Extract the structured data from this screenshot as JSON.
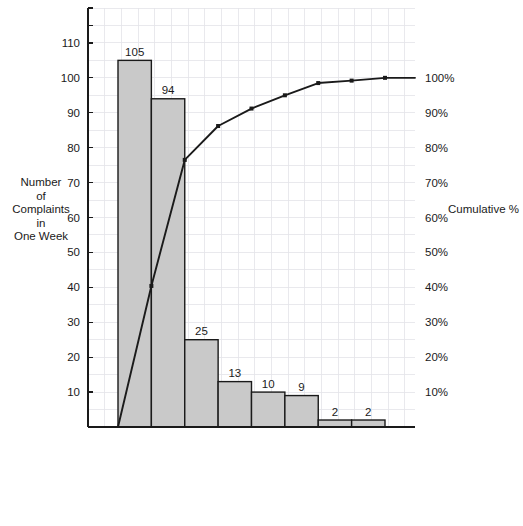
{
  "chart_data": {
    "type": "bar",
    "title": "",
    "subtitle": "",
    "categories": [
      "Cold food",
      "Salad not fresh",
      "Lack of cleanliness",
      "Food tastes bad",
      "Poor service",
      "Food too greasy",
      "Flimsy utensils",
      "Not courteous"
    ],
    "values": [
      105,
      94,
      25,
      13,
      10,
      9,
      2,
      2
    ],
    "value_labels": [
      "105",
      "94",
      "25",
      "13",
      "10",
      "9",
      "2",
      "2"
    ],
    "series": [
      {
        "name": "Number of Complaints in One Week",
        "type": "bar",
        "axis": "left",
        "values": [
          105,
          94,
          25,
          13,
          10,
          9,
          2,
          2
        ]
      },
      {
        "name": "Cumulative %",
        "type": "line",
        "axis": "right",
        "values": [
          40.4,
          76.5,
          86.2,
          91.2,
          95.0,
          98.5,
          99.2,
          100.0
        ]
      }
    ],
    "total": 260,
    "xlabel": "",
    "ylabel": "Number of Complaints in One Week",
    "ylabel_lines": [
      "Number",
      "of",
      "Complaints",
      "in",
      "One Week"
    ],
    "y2label": "Cumulative %",
    "ylim": [
      0,
      120
    ],
    "y2lim": [
      0,
      120
    ],
    "yticks": [
      10,
      20,
      30,
      40,
      50,
      60,
      70,
      80,
      90,
      100,
      110
    ],
    "ytick_labels": [
      "10",
      "20",
      "30",
      "40",
      "50",
      "60",
      "70",
      "80",
      "90",
      "100",
      "110"
    ],
    "y2ticks": [
      10,
      20,
      30,
      40,
      50,
      60,
      70,
      80,
      90,
      100
    ],
    "y2tick_labels": [
      "10%",
      "20%",
      "30%",
      "40%",
      "50%",
      "60%",
      "70%",
      "80%",
      "90%",
      "100%"
    ],
    "grid": true,
    "legend": "none",
    "bar_color": "#c9c9c9",
    "bar_edge_color": "#1a1a1a",
    "line_color": "#1a1a1a",
    "grid_color": "#e3e3e8",
    "axis_color": "#1a1a1a",
    "background": "#ffffff"
  }
}
